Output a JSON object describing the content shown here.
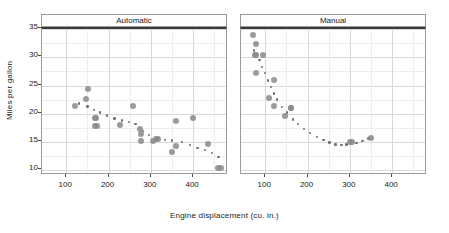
{
  "chart_data": {
    "type": "scatter",
    "title": "",
    "xlabel": "Engine displacement (cu. in.)",
    "ylabel": "Miles per gallon",
    "xlim": [
      45,
      480
    ],
    "ylim": [
      9,
      35
    ],
    "xticks": [
      100,
      200,
      300,
      400
    ],
    "yticks": [
      10,
      15,
      20,
      25,
      30,
      35
    ],
    "grid": true,
    "legend": "none",
    "panel_variable": "Transmission",
    "panels": [
      {
        "label": "Automatic",
        "points": [
          {
            "x": 121,
            "y": 21.4
          },
          {
            "x": 146,
            "y": 22.7
          },
          {
            "x": 151,
            "y": 24.4
          },
          {
            "x": 167,
            "y": 19.2
          },
          {
            "x": 170,
            "y": 19.2
          },
          {
            "x": 168,
            "y": 17.8
          },
          {
            "x": 173,
            "y": 17.8
          },
          {
            "x": 228,
            "y": 18.1
          },
          {
            "x": 258,
            "y": 21.4
          },
          {
            "x": 275,
            "y": 17.3
          },
          {
            "x": 276,
            "y": 16.4
          },
          {
            "x": 276,
            "y": 15.2
          },
          {
            "x": 304,
            "y": 15.2
          },
          {
            "x": 312,
            "y": 15.5
          },
          {
            "x": 318,
            "y": 15.5
          },
          {
            "x": 350,
            "y": 13.3
          },
          {
            "x": 360,
            "y": 14.3
          },
          {
            "x": 360,
            "y": 18.7
          },
          {
            "x": 400,
            "y": 19.2
          },
          {
            "x": 436,
            "y": 14.7
          },
          {
            "x": 458,
            "y": 10.4
          },
          {
            "x": 465,
            "y": 10.4
          }
        ],
        "trend": [
          {
            "x": 130,
            "y": 21.8
          },
          {
            "x": 150,
            "y": 21.3
          },
          {
            "x": 165,
            "y": 20.7
          },
          {
            "x": 180,
            "y": 20.2
          },
          {
            "x": 196,
            "y": 19.7
          },
          {
            "x": 214,
            "y": 19.2
          },
          {
            "x": 232,
            "y": 18.8
          },
          {
            "x": 248,
            "y": 18.5
          },
          {
            "x": 264,
            "y": 18.2
          },
          {
            "x": 282,
            "y": 17.0
          },
          {
            "x": 296,
            "y": 16.2
          },
          {
            "x": 316,
            "y": 15.6
          },
          {
            "x": 334,
            "y": 15.4
          },
          {
            "x": 350,
            "y": 15.3
          },
          {
            "x": 374,
            "y": 15.0
          },
          {
            "x": 392,
            "y": 14.5
          },
          {
            "x": 410,
            "y": 14.0
          },
          {
            "x": 428,
            "y": 13.6
          },
          {
            "x": 444,
            "y": 13.1
          },
          {
            "x": 460,
            "y": 12.4
          }
        ]
      },
      {
        "label": "Manual",
        "points": [
          {
            "x": 71,
            "y": 33.9
          },
          {
            "x": 78,
            "y": 32.4
          },
          {
            "x": 75,
            "y": 30.4
          },
          {
            "x": 79,
            "y": 30.4
          },
          {
            "x": 95,
            "y": 30.4
          },
          {
            "x": 79,
            "y": 27.3
          },
          {
            "x": 120,
            "y": 26.0
          },
          {
            "x": 108,
            "y": 22.8
          },
          {
            "x": 120,
            "y": 21.4
          },
          {
            "x": 160,
            "y": 21.0
          },
          {
            "x": 160,
            "y": 21.0
          },
          {
            "x": 146,
            "y": 19.7
          },
          {
            "x": 301,
            "y": 15.0
          },
          {
            "x": 304,
            "y": 15.0
          },
          {
            "x": 351,
            "y": 15.8
          }
        ],
        "trend": [
          {
            "x": 74,
            "y": 31.2
          },
          {
            "x": 80,
            "y": 30.6
          },
          {
            "x": 86,
            "y": 29.5
          },
          {
            "x": 92,
            "y": 28.3
          },
          {
            "x": 100,
            "y": 27.2
          },
          {
            "x": 107,
            "y": 25.9
          },
          {
            "x": 113,
            "y": 24.7
          },
          {
            "x": 120,
            "y": 23.6
          },
          {
            "x": 128,
            "y": 22.5
          },
          {
            "x": 140,
            "y": 21.2
          },
          {
            "x": 152,
            "y": 20.2
          },
          {
            "x": 166,
            "y": 19.0
          },
          {
            "x": 178,
            "y": 18.2
          },
          {
            "x": 192,
            "y": 17.3
          },
          {
            "x": 206,
            "y": 16.6
          },
          {
            "x": 222,
            "y": 15.9
          },
          {
            "x": 238,
            "y": 15.4
          },
          {
            "x": 252,
            "y": 14.9
          },
          {
            "x": 266,
            "y": 14.6
          },
          {
            "x": 280,
            "y": 14.5
          },
          {
            "x": 292,
            "y": 14.6
          },
          {
            "x": 316,
            "y": 14.8
          },
          {
            "x": 330,
            "y": 15.2
          },
          {
            "x": 344,
            "y": 15.6
          }
        ]
      }
    ]
  },
  "style": {
    "marker_color": "#8a8a8a",
    "trend_color": "#6f6f6f",
    "grid_color": "#d8d8d8",
    "frame_color": "#9a9a9a",
    "strip_background": "#fdfdfd"
  }
}
